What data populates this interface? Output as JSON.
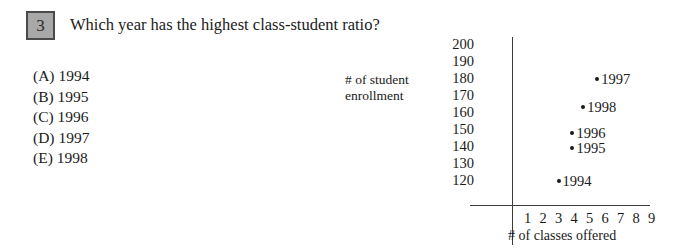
{
  "question": {
    "number": "3",
    "text": "Which year has the highest class-student ratio?"
  },
  "choices": [
    {
      "label": "(A) 1994"
    },
    {
      "label": "(B) 1995"
    },
    {
      "label": "(C) 1996"
    },
    {
      "label": "(D) 1997"
    },
    {
      "label": "(E) 1998"
    }
  ],
  "chart_data": {
    "type": "scatter",
    "title": "",
    "xlabel": "# of classes offered",
    "ylabel": "# of student enrollment",
    "ylabel_lines": [
      "# of student",
      "enrollment"
    ],
    "xlim": [
      0,
      9.8
    ],
    "ylim": [
      115,
      204
    ],
    "grid": false,
    "legend": "none",
    "xticks": [
      "1",
      "2",
      "3",
      "4",
      "5",
      "6",
      "7",
      "8",
      "9"
    ],
    "yticks": [
      "200",
      "190",
      "180",
      "170",
      "160",
      "150",
      "140",
      "130",
      "120"
    ],
    "points": [
      {
        "label": "1997",
        "x": 5.5,
        "y": 180,
        "label_side": "right"
      },
      {
        "label": "1998",
        "x": 4.6,
        "y": 163,
        "label_side": "right"
      },
      {
        "label": "1996",
        "x": 3.9,
        "y": 148,
        "label_side": "right"
      },
      {
        "label": "1995",
        "x": 3.9,
        "y": 139,
        "label_side": "right"
      },
      {
        "label": "1994",
        "x": 3.0,
        "y": 120,
        "label_side": "right"
      }
    ]
  },
  "colors": {
    "ink": "#1a1a1a",
    "axis": "#3c3c3c",
    "number_box_fill": "#a8a8a8",
    "number_box_border": "#4a4a4a"
  }
}
